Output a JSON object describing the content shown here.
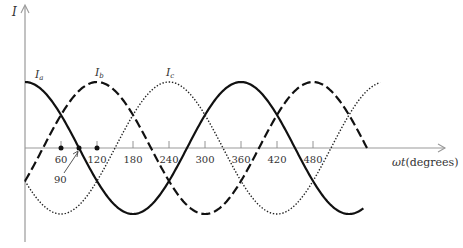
{
  "chart_data": {
    "type": "line",
    "title": "",
    "xlabel": "ωt(degrees)",
    "ylabel": "I",
    "x_ticks": [
      60,
      120,
      180,
      240,
      300,
      360,
      420,
      480
    ],
    "x_range": [
      0,
      590
    ],
    "y_range": [
      -1,
      1
    ],
    "grid": false,
    "marked_points": [
      {
        "x": 60,
        "label": "60"
      },
      {
        "x": 90,
        "label": "90",
        "annotated_with_arrow": true
      },
      {
        "x": 120,
        "label": "120"
      }
    ],
    "series": [
      {
        "name": "Ia",
        "label": "I_a",
        "style": "solid",
        "function": "cos(ωt)",
        "phase_deg": 0,
        "x_end": 565
      },
      {
        "name": "Ib",
        "label": "I_b",
        "style": "dashed",
        "function": "cos(ωt - 120°)",
        "phase_deg": 120,
        "x_end": 570
      },
      {
        "name": "Ic",
        "label": "I_c",
        "style": "dotted",
        "function": "cos(ωt - 240°)",
        "phase_deg": 240,
        "x_end": 592
      }
    ]
  },
  "axes": {
    "y_label": "I",
    "x_label": "ωt(degrees)",
    "ticks": [
      "60",
      "120",
      "180",
      "240",
      "300",
      "360",
      "420",
      "480"
    ],
    "annotation_90": "90"
  },
  "legend": {
    "ia_main": "I",
    "ia_sub": "a",
    "ib_main": "I",
    "ib_sub": "b",
    "ic_main": "I",
    "ic_sub": "c"
  },
  "colors": {
    "curve": "#111111",
    "axis": "#888888",
    "text": "#333333"
  }
}
